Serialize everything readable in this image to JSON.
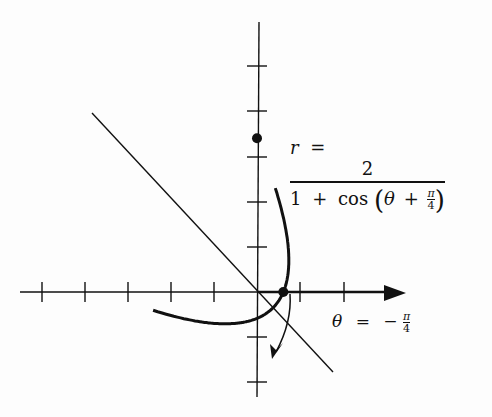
{
  "figure": {
    "equation": {
      "lhs": "r",
      "equals": "=",
      "numerator": "2",
      "den_one": "1",
      "den_plus": "+",
      "den_cos": "cos",
      "den_open": "(",
      "den_theta": "θ",
      "den_plus2": "+",
      "den_pi": "π",
      "den_four": "4",
      "den_close": ")"
    },
    "angle_label": {
      "theta": "θ",
      "equals": "=",
      "minus": "−",
      "pi": "π",
      "four": "4"
    },
    "colors": {
      "ink": "#111111",
      "background": "#fdfdfd"
    }
  },
  "chart_data": {
    "type": "line",
    "coordinate_system": "polar",
    "origin_px": [
      257,
      292
    ],
    "scale_px_per_unit": 22.5,
    "tick_spacing_units": 2,
    "x_ticks_px": [
      42,
      85,
      128,
      171,
      214,
      300,
      344
    ],
    "y_ticks_px": [
      66,
      111,
      157,
      202,
      247,
      337,
      382
    ],
    "curve": {
      "equation": "r = 2/(1 + cos(θ + π/4))",
      "theta_range_deg": [
        -170,
        80
      ]
    },
    "axis_of_symmetry": {
      "label": "θ = −π/4",
      "angle_rad": -0.7854
    },
    "marked_points": [
      {
        "label": "x-intercept",
        "theta": 0,
        "r": 1.17
      },
      {
        "label": "y-intercept",
        "theta": 1.5708,
        "r": 6.83
      }
    ],
    "xlabel": "",
    "ylabel": "",
    "grid": false
  }
}
